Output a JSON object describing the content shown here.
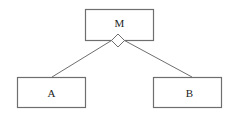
{
  "diagram": {
    "type": "aggregation",
    "nodes": [
      {
        "id": "M",
        "label": "M",
        "role": "whole"
      },
      {
        "id": "A",
        "label": "A",
        "role": "part"
      },
      {
        "id": "B",
        "label": "B",
        "role": "part"
      }
    ],
    "edges": [
      {
        "from": "A",
        "to": "M",
        "end_marker": "hollow-diamond"
      },
      {
        "from": "B",
        "to": "M",
        "end_marker": "hollow-diamond"
      }
    ],
    "colors": {
      "stroke": "#6e6e6e",
      "text": "#222222",
      "background": "#ffffff"
    }
  }
}
